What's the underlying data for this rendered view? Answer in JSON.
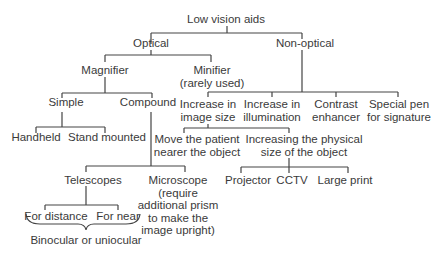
{
  "diagram": {
    "root": "Low vision aids",
    "optical": "Optical",
    "non_optical": "Non-optical",
    "magnifier": "Magnifier",
    "minifier": [
      "Minifier",
      "(rarely used)"
    ],
    "simple": "Simple",
    "compound": "Compound",
    "handheld": "Handheld",
    "stand_mounted": "Stand mounted",
    "telescopes": "Telescopes",
    "microscope": [
      "Microscope",
      "(require",
      "additional prism",
      "to make the",
      "image upright)"
    ],
    "for_distance": "For distance",
    "for_near": "For near",
    "binocular": "Binocular or uniocular",
    "increase_image_size": [
      "Increase in",
      "image size"
    ],
    "increase_illumination": [
      "Increase in",
      "illumination"
    ],
    "contrast_enhancer": [
      "Contrast",
      "enhancer"
    ],
    "special_pen": [
      "Special pen",
      "for signature"
    ],
    "move_patient": [
      "Move the patient",
      "nearer the object"
    ],
    "increasing_physical": [
      "Increasing the physical",
      "size of the object"
    ],
    "projector": "Projector",
    "cctv": "CCTV",
    "large_print": "Large print"
  },
  "colors": {
    "line": "#444444",
    "text": "#3a3a3a"
  }
}
